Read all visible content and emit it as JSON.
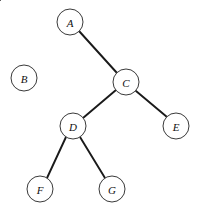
{
  "diagram": {
    "type": "tree",
    "background_color": "#ffffff",
    "node_fill": "#ffffff",
    "node_stroke": "#3a3a3a",
    "edge_color": "#1a1a1a",
    "label_color": "#111111",
    "node_radius": 13,
    "canvas": {
      "width": 207,
      "height": 215
    },
    "nodes": [
      {
        "id": "A",
        "label": "A",
        "cx": 70,
        "cy": 22
      },
      {
        "id": "B",
        "label": "B",
        "cx": 24,
        "cy": 78
      },
      {
        "id": "C",
        "label": "C",
        "cx": 126,
        "cy": 82
      },
      {
        "id": "D",
        "label": "D",
        "cx": 73,
        "cy": 126
      },
      {
        "id": "E",
        "label": "E",
        "cx": 176,
        "cy": 126
      },
      {
        "id": "F",
        "label": "F",
        "cx": 40,
        "cy": 189
      },
      {
        "id": "G",
        "label": "G",
        "cx": 112,
        "cy": 189
      }
    ],
    "edges": [
      {
        "from": "A",
        "to": "B",
        "x1": 61,
        "y1": 31,
        "x2": 32,
        "y2": 69
      },
      {
        "from": "A",
        "to": "C",
        "x1": 79,
        "y1": 31,
        "x2": 117,
        "y2": 73
      },
      {
        "from": "C",
        "to": "D",
        "x1": 116,
        "y1": 90,
        "x2": 83,
        "y2": 118
      },
      {
        "from": "C",
        "to": "E",
        "x1": 136,
        "y1": 91,
        "x2": 167,
        "y2": 117
      },
      {
        "from": "D",
        "to": "F",
        "x1": 66,
        "y1": 137,
        "x2": 47,
        "y2": 178
      },
      {
        "from": "D",
        "to": "G",
        "x1": 80,
        "y1": 137,
        "x2": 105,
        "y2": 178
      }
    ]
  }
}
